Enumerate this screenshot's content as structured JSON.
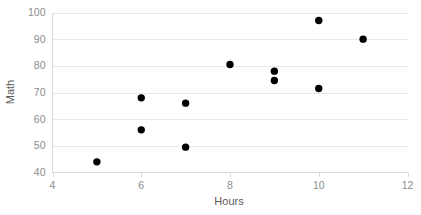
{
  "chart_data": {
    "type": "scatter",
    "title": "",
    "xlabel": "Hours",
    "ylabel": "Math",
    "xlim": [
      4,
      12
    ],
    "ylim": [
      40,
      100
    ],
    "x_ticks": [
      4,
      6,
      8,
      10,
      12
    ],
    "y_ticks": [
      40,
      50,
      60,
      70,
      80,
      90,
      100
    ],
    "x_tick_labels": [
      "4",
      "6",
      "8",
      "10",
      "12"
    ],
    "y_tick_labels": [
      "40",
      "50",
      "60",
      "70",
      "80",
      "90",
      "100"
    ],
    "grid": "horizontal",
    "legend": "none",
    "marker_color": "#000000",
    "gridline_color": "#e8e8e8",
    "axis_color": "#d9d9d9",
    "label_color": "#8c8c8c",
    "title_color": "#595959",
    "background": "#ffffff",
    "series": [
      {
        "name": "Math vs Hours",
        "points": [
          {
            "x": 5,
            "y": 44
          },
          {
            "x": 6,
            "y": 68
          },
          {
            "x": 6,
            "y": 56
          },
          {
            "x": 7,
            "y": 66
          },
          {
            "x": 7,
            "y": 49.5
          },
          {
            "x": 8,
            "y": 80.5
          },
          {
            "x": 9,
            "y": 78
          },
          {
            "x": 9,
            "y": 74.5
          },
          {
            "x": 10,
            "y": 97
          },
          {
            "x": 10,
            "y": 71.5
          },
          {
            "x": 11,
            "y": 90
          }
        ]
      }
    ]
  }
}
